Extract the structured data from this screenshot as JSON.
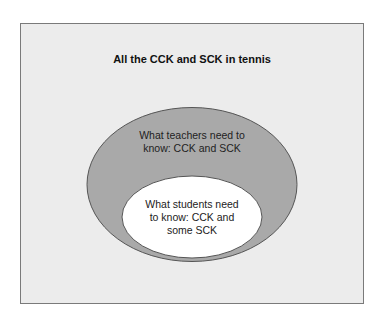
{
  "diagram": {
    "title": "All the CCK and SCK in tennis",
    "outer_set": {
      "label_line1": "What teachers need to",
      "label_line2": "know: CCK and SCK",
      "fill": "#a9a9a9"
    },
    "inner_set": {
      "label_line1": "What students need",
      "label_line2": "to know: CCK and",
      "label_line3": "some SCK",
      "fill": "#ffffff"
    },
    "background": "#ececec"
  }
}
